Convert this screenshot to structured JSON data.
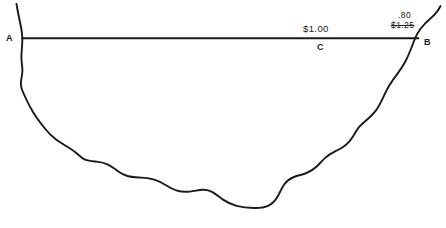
{
  "diagram": {
    "background_color": "#ffffff",
    "ink_color": "#1a1a1a",
    "labels": {
      "point_a": "A",
      "point_b": "B",
      "point_c": "C",
      "price_main": "$1.00",
      "price_new": ".80",
      "price_old": "$1.25"
    }
  }
}
